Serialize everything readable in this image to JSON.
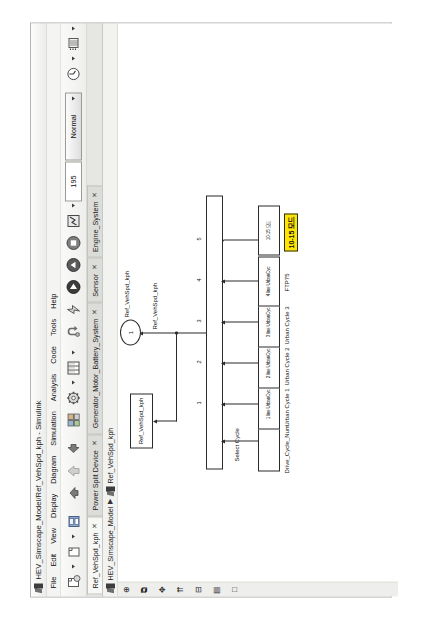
{
  "window": {
    "title": "HEV_Simscape_Model/Ref_VehSpd_kph - Simulink",
    "app_icon": "simulink-logo-icon"
  },
  "menu": {
    "items": [
      {
        "label": "File",
        "mnemonic": "F"
      },
      {
        "label": "Edit",
        "mnemonic": "E"
      },
      {
        "label": "View",
        "mnemonic": "V"
      },
      {
        "label": "Display",
        "mnemonic": "D"
      },
      {
        "label": "Diagram",
        "mnemonic": "a"
      },
      {
        "label": "Simulation",
        "mnemonic": "S"
      },
      {
        "label": "Analysis",
        "mnemonic": "A"
      },
      {
        "label": "Code",
        "mnemonic": "C"
      },
      {
        "label": "Tools",
        "mnemonic": "T"
      },
      {
        "label": "Help",
        "mnemonic": "H"
      }
    ]
  },
  "toolbar": {
    "new_model_label": "new-model",
    "open_label": "open-model",
    "save_label": "save-model",
    "print_label": "print",
    "back_label": "navigate-back",
    "forward_label": "navigate-forward",
    "up_label": "navigate-up-to-parent",
    "library_browser_label": "library-browser",
    "model_explorer_label": "model-explorer",
    "model_configuration_label": "model-configuration-parameters",
    "update_diagram_label": "update-diagram",
    "run_label": "run",
    "step_forward_label": "step-forward",
    "stop_label": "stop",
    "fast_restart_label": "fast-restart",
    "sim_stop_time": "195",
    "sim_mode": "Normal",
    "sim_mode_options": [
      "Normal",
      "Accelerator",
      "Rapid Accelerator",
      "External"
    ],
    "data_inspector_label": "simulation-data-inspector",
    "scope_label": "scope",
    "legend_label": "legend"
  },
  "tabs": [
    {
      "label": "Ref_VehSpd_kph",
      "close": "✕",
      "active": true
    },
    {
      "label": "Power Split Device",
      "close": "✕",
      "active": false
    },
    {
      "label": "Generator_Motor_Battery_System",
      "close": "✕",
      "active": false
    },
    {
      "label": "Sensor",
      "close": "✕",
      "active": false
    },
    {
      "label": "Engine_System",
      "close": "✕",
      "active": false
    }
  ],
  "breadcrumb": {
    "icon": "simulink-model-icon",
    "root": "HEV_Simscape_Model",
    "separator": "▶",
    "current": "Ref_VehSpd_kph",
    "current_icon": "subsystem-icon"
  },
  "left_rail": {
    "items": [
      {
        "name": "model-browser-toggle",
        "glyph": "⊕"
      },
      {
        "name": "zoom-fit-icon",
        "glyph": "⧉"
      },
      {
        "name": "pan-icon",
        "glyph": "✥"
      },
      {
        "name": "zoom-in-icon",
        "glyph": "⇈"
      },
      {
        "name": "zoom-out-icon",
        "glyph": "⊟"
      },
      {
        "name": "explore-icon",
        "glyph": "▤"
      },
      {
        "name": "hide-icon",
        "glyph": "□"
      }
    ]
  },
  "canvas": {
    "blocks": [
      {
        "id": "drive_cycle_num",
        "label": "Drive_Cycle_Num",
        "inner": "",
        "type": "constant"
      },
      {
        "id": "urban_cycle_1",
        "label": "Urban Cycle 1",
        "inner": "1 line UrbanCyc",
        "type": "from-workspace"
      },
      {
        "id": "urban_cycle_2",
        "label": "Urban Cycle 2",
        "inner": "2 line UrbanCyc",
        "type": "from-workspace"
      },
      {
        "id": "urban_cycle_3",
        "label": "Urban Cycle 3",
        "inner": "3 line UrbanCyc",
        "type": "from-workspace"
      },
      {
        "id": "ftp75",
        "label": "FTP75",
        "inner": "4 line UrbanCyc",
        "type": "from-workspace"
      },
      {
        "id": "mode_cycle",
        "label": "",
        "inner": "10-15 모드",
        "type": "from-workspace-highlighted"
      }
    ],
    "switch": {
      "name": "multiport-switch",
      "select_label": "Select Cycle",
      "port_numbers": [
        "1",
        "2",
        "3",
        "4",
        "5"
      ]
    },
    "signal_labels": [
      "Ref_VehSpd_kph",
      "Ref_VehSpd_kph"
    ],
    "goto_block": {
      "label": "Ref_VehSpd_kph"
    },
    "outport": {
      "number": "1",
      "label": "Ref_VehSpd_kph"
    },
    "annotation": {
      "text": "10-15 모드",
      "highlight_color": "#ffe600"
    }
  }
}
